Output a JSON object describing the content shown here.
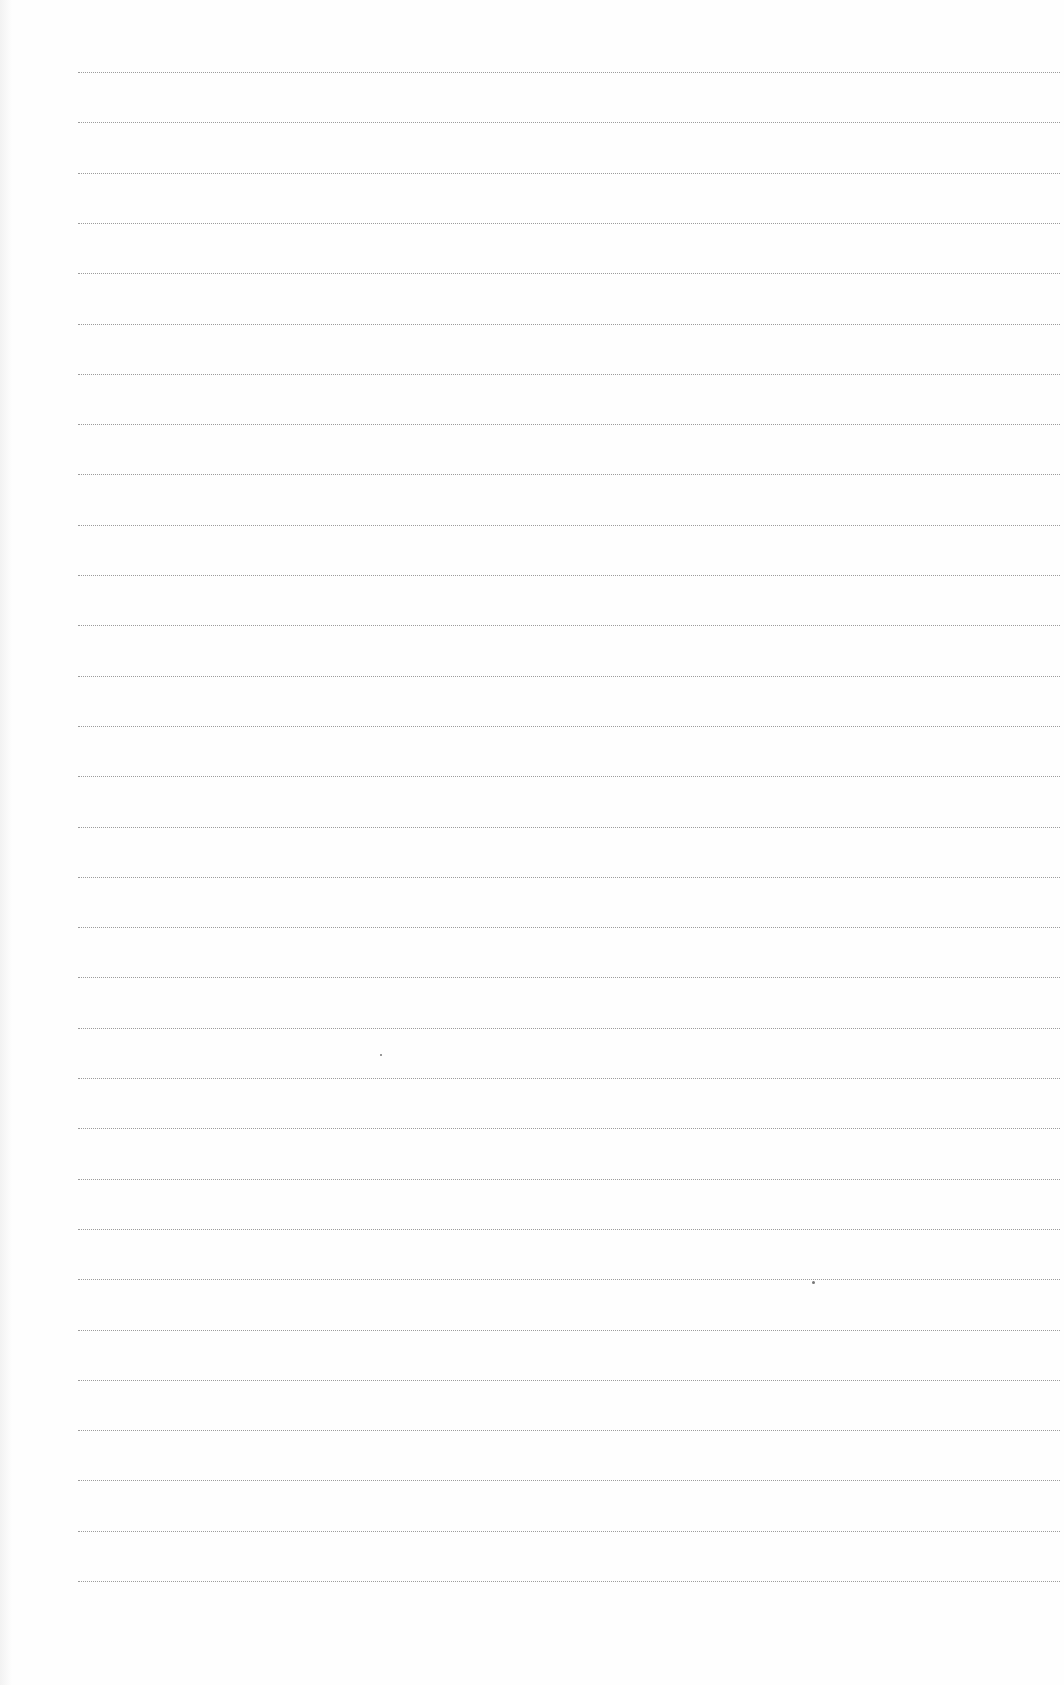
{
  "page": {
    "type": "blank ruled sheet",
    "background_color": "#fefefe",
    "rule_color": "#8c8c8c",
    "rule_style": "dotted",
    "rule_count": 31,
    "first_rule_y": 72,
    "rule_spacing_px": 50.3,
    "rule_left_x": 78,
    "rule_right_x": 1060
  }
}
